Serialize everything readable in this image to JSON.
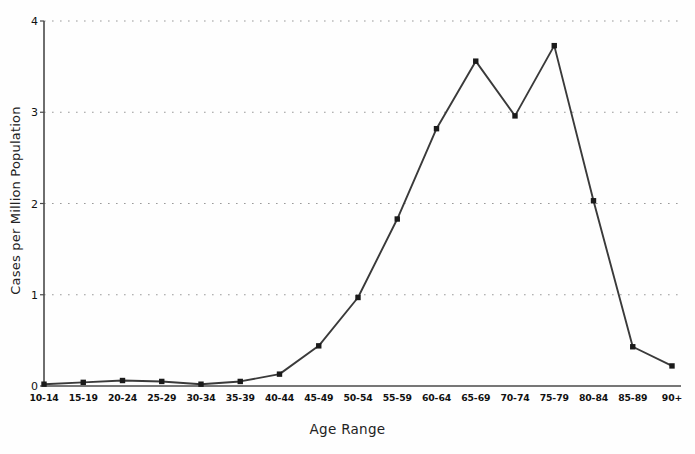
{
  "chart_data": {
    "type": "line",
    "title": "",
    "xlabel": "Age Range",
    "ylabel": "Cases per Million Population",
    "categories": [
      "10-14",
      "15-19",
      "20-24",
      "25-29",
      "30-34",
      "35-39",
      "40-44",
      "45-49",
      "50-54",
      "55-59",
      "60-64",
      "65-69",
      "70-74",
      "75-79",
      "80-84",
      "85-89",
      "90+"
    ],
    "values": [
      0.02,
      0.04,
      0.06,
      0.05,
      0.02,
      0.05,
      0.13,
      0.44,
      0.97,
      1.83,
      2.82,
      3.56,
      2.96,
      3.73,
      2.03,
      0.43,
      0.22
    ],
    "ylim": [
      0,
      4
    ],
    "yticks": [
      0,
      1,
      2,
      3,
      4
    ],
    "ytick_labels": [
      "0",
      "1",
      "2",
      "3",
      "4"
    ],
    "grid": "horizontal-dotted",
    "legend": "none",
    "marker": "square",
    "line_color": "#3a3a3a",
    "marker_color": "#1a1a1a",
    "grid_color": "#9a9a9a",
    "axis_color": "#4a4a4a"
  }
}
